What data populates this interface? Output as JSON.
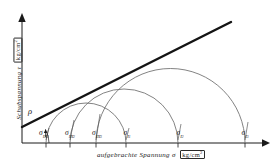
{
  "figure": {
    "kind": "mohr-circle-failure-envelope",
    "background_color": "#ffffff",
    "ink_color": "#1a1a1a",
    "circle_color": "#6d6d6d",
    "envelope_color": "#141414"
  },
  "axes": {
    "y_label_text": "Schubspannung",
    "y_label_symbol": "τ",
    "y_label_unit": "kg/cm",
    "y_label_unit_exp": "2",
    "x_label_text": "aufgebrachte Spannung",
    "x_label_symbol": "σ",
    "x_label_unit": "kg/cm",
    "x_label_unit_exp": "2",
    "origin_x": 22,
    "origin_y": 143,
    "x_axis_end": 265,
    "y_axis_top": 15
  },
  "angle": {
    "symbol": "ρ",
    "x": 28,
    "y": 106
  },
  "envelope": {
    "x1": 22,
    "y1": 127,
    "x2": 231,
    "y2": 22,
    "stroke_width": 2.4
  },
  "chart_data": {
    "type": "line",
    "title": "",
    "xlabel": "aufgebrachte Spannung σ [kg/cm2]",
    "ylabel": "Schubspannung τ [kg/cm2]",
    "grid": false,
    "legend": "none",
    "circles": [
      {
        "id": "circle-1",
        "sigma3_x": 46,
        "sigma1_x": 126,
        "cx": 86,
        "r": 40
      },
      {
        "id": "circle-2",
        "sigma3_x": 70,
        "sigma1_x": 178,
        "cx": 124,
        "r": 54
      },
      {
        "id": "circle-3",
        "sigma3_x": 96,
        "sigma1_x": 245,
        "cx": 170.5,
        "r": 74.5
      }
    ],
    "series": [
      {
        "name": "Bruchgerade (failure envelope)",
        "x": [
          22,
          231
        ],
        "y_px": [
          127,
          22
        ]
      }
    ]
  },
  "ticks": [
    {
      "key": "s3_1",
      "x": 46,
      "label_x": 44,
      "sym": "σ",
      "sub": "III",
      "subsub": "1"
    },
    {
      "key": "s3_2",
      "x": 70,
      "label_x": 70,
      "sym": "σ",
      "sub": "III",
      "subsub": "2"
    },
    {
      "key": "s3_3",
      "x": 96,
      "label_x": 97,
      "sym": "σ",
      "sub": "III",
      "subsub": "3"
    },
    {
      "key": "s1_1",
      "x": 126,
      "label_x": 127,
      "sym": "σ",
      "sub": "I",
      "subsub": "1"
    },
    {
      "key": "s1_2",
      "x": 178,
      "label_x": 180,
      "sym": "σ",
      "sub": "I",
      "subsub": "2"
    },
    {
      "key": "s1_3",
      "x": 245,
      "label_x": 245,
      "sym": "σ",
      "sub": "I",
      "subsub": "3"
    }
  ],
  "leaders": [
    {
      "from_x": 49,
      "from_y": 127,
      "to_x": 46,
      "to_y": 141
    },
    {
      "from_x": 74,
      "from_y": 118,
      "to_x": 70,
      "to_y": 141
    },
    {
      "from_x": 100,
      "from_y": 112,
      "to_x": 96,
      "to_y": 141
    },
    {
      "from_x": 129,
      "from_y": 126,
      "to_x": 126,
      "to_y": 141
    },
    {
      "from_x": 181,
      "from_y": 120,
      "to_x": 178,
      "to_y": 141
    },
    {
      "from_x": 248,
      "from_y": 119,
      "to_x": 245,
      "to_y": 141
    }
  ]
}
